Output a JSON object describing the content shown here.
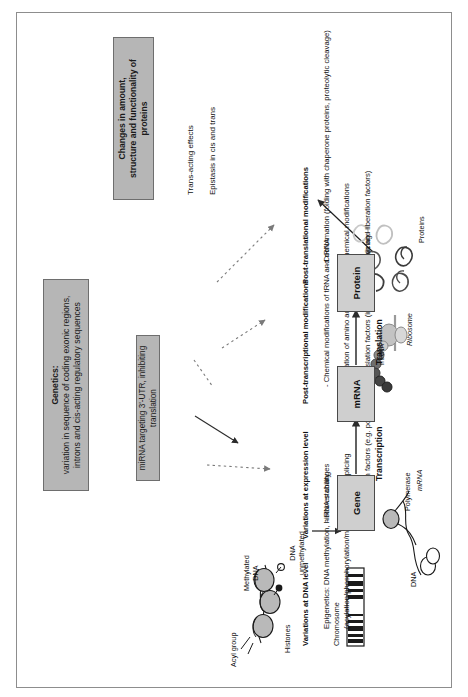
{
  "figure": {
    "title_boxes": {
      "genetics": {
        "heading": "Genetics:",
        "line1": "variation in sequence of coding exonic regions,",
        "line2": "introns and cis-acting regulatory sequences"
      },
      "mirna": {
        "text": "miRNA targeting  3'-UTR, inhibiting translation"
      },
      "outcome": {
        "line1": "Changes in amount,",
        "line2": "structure and functionality of proteins"
      }
    },
    "annotations": {
      "dna_level": {
        "heading": "Variations at DNA level",
        "line1": "Epigenetics: DNA methylation, histones changes",
        "line2": "(acylation/phosphorylation/methylation)"
      },
      "expression_level": {
        "heading": "Variations at expression level",
        "bullets": [
          "- RNA stability",
          "- Alternative splicing",
          "- Transcription factors (e.g. polymerases)"
        ]
      },
      "post_transcriptional": {
        "heading": "Post-transcriptional modifications",
        "bullets": [
          "- Chemical modifications of tRNA and rRNA",
          "- Acylation of amino acids",
          "- Translation factors (initiation, elongation and liberation factors)"
        ]
      },
      "post_translational": {
        "heading": "Post-translational modifications",
        "bullets": [
          "- Conformation (folding with chaperone proteins, proteolytic cleavage)",
          "- Chemical modifications",
          "- Splicing"
        ]
      },
      "effects": [
        "Trans-acting effects",
        "Epistasis in cis and trans"
      ]
    },
    "flow": {
      "nodes": [
        {
          "label": "Gene"
        },
        {
          "label": "mRNA"
        },
        {
          "label": "Protein"
        }
      ],
      "steps": [
        {
          "label": "Transcription"
        },
        {
          "label": "Translation"
        }
      ]
    },
    "schematic_labels": {
      "chromosome": "Chromosome",
      "acyl_group": "Acyl group",
      "histones": "Histones",
      "methylated_dna_l1": "Methylated",
      "methylated_dna_l2": "DNA",
      "unmethylated_dna_l1": "DNA",
      "unmethylated_dna_l2": "unmethylated",
      "dna": "DNA",
      "polymerase": "Polymerase",
      "mrna_transcription": "mRNA",
      "mrna_translation": "mRNA",
      "ribosome": "Ribosome",
      "proteins": "Proteins"
    },
    "colors": {
      "gray_box": "#b6b6b6",
      "flow_box": "#cfcfcf",
      "frame": "#8d8d8d",
      "ink": "#111111"
    }
  }
}
